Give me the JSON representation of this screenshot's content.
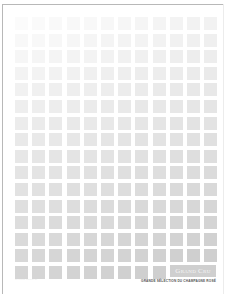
{
  "page": {
    "type": "brochure-cover",
    "grid": {
      "columns": 12,
      "rows": 16,
      "col_pitch_px": 17.2,
      "row_pitch_px": 16.6,
      "cell_size_px": 13,
      "gradient": {
        "top_left_color": "#fbfbfb",
        "bottom_right_color": "#cccccc"
      },
      "logo_replaces_last_row_columns": [
        10,
        11,
        12
      ]
    },
    "logo": {
      "text": "Grand Cru",
      "bar_color": "#cfcfcf",
      "text_color": "#f6f6f6"
    },
    "tagline": "GRANDE SÉLECTION DU CHAMPAGNE ROSÉ",
    "footer_left": "··· ········ ········· ···",
    "colors": {
      "frame": "#b8b8b8",
      "background": "#ffffff",
      "tagline": "#555555"
    }
  }
}
